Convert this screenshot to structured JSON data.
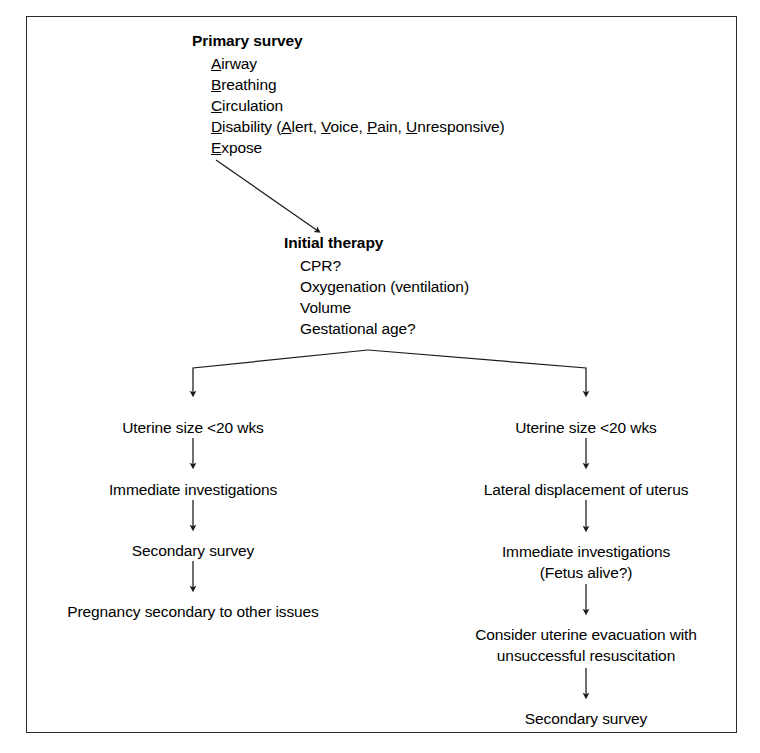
{
  "diagram": {
    "frame_color": "#2b2b2b",
    "text_color": "#000000",
    "primary_survey": {
      "heading": "Primary survey",
      "items": [
        {
          "mnemonic": "A",
          "rest": "irway",
          "full": "Airway"
        },
        {
          "mnemonic": "B",
          "rest": "reathing",
          "full": "Breathing"
        },
        {
          "mnemonic": "C",
          "rest": "irculation",
          "full": "Circulation"
        },
        {
          "mnemonic": "D",
          "rest": "isability",
          "full": "Disability (Alert, Voice, Pain, Unresponsive)"
        },
        {
          "mnemonic": "E",
          "rest": "xpose",
          "full": "Expose"
        }
      ],
      "disability_parts": {
        "lead_letter": "D",
        "lead_rest": "isability (",
        "sub": [
          {
            "letter": "A",
            "rest": "lert"
          },
          {
            "letter": "V",
            "rest": "oice"
          },
          {
            "letter": "P",
            "rest": "ain"
          },
          {
            "letter": "U",
            "rest": "nresponsive"
          }
        ],
        "separator": ", ",
        "close": ")"
      }
    },
    "initial_therapy": {
      "heading": "Initial therapy",
      "items": [
        "CPR?",
        "Oxygenation (ventilation)",
        "Volume",
        "Gestational age?"
      ]
    },
    "left_branch": {
      "nodes": [
        "Uterine size <20 wks",
        "Immediate investigations",
        "Secondary survey",
        "Pregnancy secondary to other issues"
      ]
    },
    "right_branch": {
      "nodes": [
        "Uterine size <20 wks",
        "Lateral displacement of uterus",
        "Immediate investigations",
        "(Fetus alive?)",
        "Consider uterine evacuation with",
        "unsuccessful resuscitation",
        "Secondary survey"
      ]
    }
  }
}
